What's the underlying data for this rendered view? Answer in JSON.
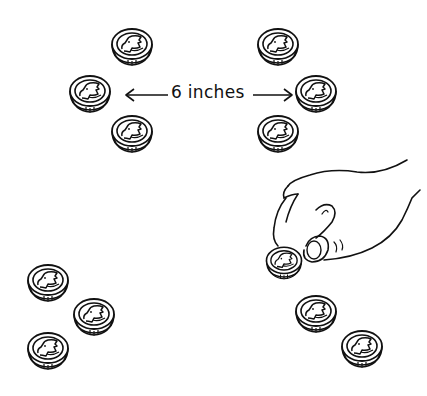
{
  "illustration": {
    "description": "Line drawing of coins arranged in groups with a hand picking up a coin",
    "stroke_color": "#111111",
    "background_color": "#ffffff",
    "measurement_label": {
      "number": "6",
      "unit": "inches",
      "text": "6 inches"
    },
    "coin_groups": [
      {
        "name": "top-left-group",
        "count": 3
      },
      {
        "name": "top-right-group",
        "count": 3
      },
      {
        "name": "bottom-left-group",
        "count": 3
      },
      {
        "name": "bottom-right-group",
        "count": 3
      }
    ],
    "icons": {
      "coin": "coin-icon",
      "hand": "hand-icon",
      "arrow_left": "arrow-left-icon",
      "arrow_right": "arrow-right-icon"
    }
  }
}
